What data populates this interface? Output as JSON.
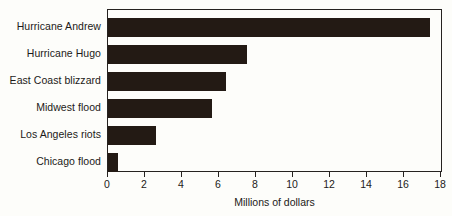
{
  "chart_data": {
    "type": "bar",
    "orientation": "horizontal",
    "title": "",
    "xlabel": "Millions of dollars",
    "ylabel": "",
    "categories": [
      "Hurricane Andrew",
      "Hurricane Hugo",
      "East Coast blizzard",
      "Midwest flood",
      "Los Angeles riots",
      "Chicago flood"
    ],
    "values": [
      17.4,
      7.5,
      6.4,
      5.6,
      2.6,
      0.55
    ],
    "xlim": [
      0,
      18
    ],
    "xticks": [
      0,
      2,
      4,
      6,
      8,
      10,
      12,
      14,
      16,
      18
    ],
    "xtick_labels": [
      "0",
      "2",
      "4",
      "6",
      "8",
      "10",
      "12",
      "14",
      "16",
      "18"
    ],
    "grid": false,
    "legend": null,
    "bar_color": "#231a14",
    "frame_color": "#262220",
    "background_color": "#fdfdfa"
  }
}
